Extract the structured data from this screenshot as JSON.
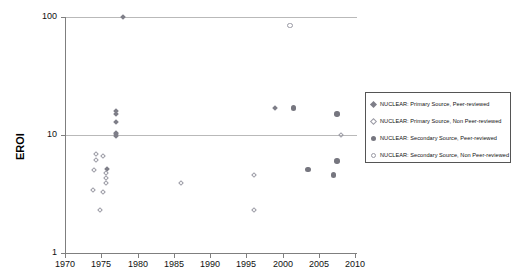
{
  "chart_data": {
    "type": "scatter",
    "title": "",
    "xlabel": "",
    "ylabel": "EROI",
    "xlim": [
      1970,
      2010
    ],
    "ylim": [
      1,
      100
    ],
    "yscale": "log",
    "grid": true,
    "legend_position": "right",
    "xticks": [
      "1970",
      "1975",
      "1980",
      "1985",
      "1990",
      "1995",
      "2000",
      "2005",
      "2010"
    ],
    "yticks": [
      "1",
      "10",
      "100"
    ],
    "series": [
      {
        "name": "NUCLEAR: Primary Source, Peer-reviewed",
        "marker": "filled-diamond",
        "color": "#7e7e88",
        "points": [
          {
            "x": 1978,
            "y": 100
          },
          {
            "x": 1977,
            "y": 16
          },
          {
            "x": 1977,
            "y": 15
          },
          {
            "x": 1977,
            "y": 13
          },
          {
            "x": 1977,
            "y": 10.4
          },
          {
            "x": 1977,
            "y": 10.1
          },
          {
            "x": 1977,
            "y": 9.8
          },
          {
            "x": 1975.8,
            "y": 5.2
          },
          {
            "x": 1999,
            "y": 17
          }
        ]
      },
      {
        "name": "NUCLEAR: Primary Source, Non Peer-reviewed",
        "marker": "open-diamond",
        "color": "#9a9aa4",
        "points": [
          {
            "x": 1974.3,
            "y": 6.9
          },
          {
            "x": 1975.3,
            "y": 6.7
          },
          {
            "x": 1974.3,
            "y": 6.1
          },
          {
            "x": 1974.0,
            "y": 5.1
          },
          {
            "x": 1975.6,
            "y": 4.8
          },
          {
            "x": 1975.6,
            "y": 4.3
          },
          {
            "x": 1975.6,
            "y": 3.9
          },
          {
            "x": 1973.8,
            "y": 3.4
          },
          {
            "x": 1975.3,
            "y": 3.3
          },
          {
            "x": 1974.8,
            "y": 2.3
          },
          {
            "x": 1986,
            "y": 3.9
          },
          {
            "x": 1996,
            "y": 4.6
          },
          {
            "x": 1996,
            "y": 2.3
          },
          {
            "x": 2008,
            "y": 10
          }
        ]
      },
      {
        "name": "NUCLEAR: Secondary Source, Peer-reviewed",
        "marker": "filled-circle",
        "color": "#76767f",
        "points": [
          {
            "x": 2001.5,
            "y": 17
          },
          {
            "x": 2007.5,
            "y": 15
          },
          {
            "x": 2003.5,
            "y": 5.1
          },
          {
            "x": 2007.5,
            "y": 6.0
          },
          {
            "x": 2007.0,
            "y": 4.6
          }
        ]
      },
      {
        "name": "NUCLEAR: Secondary Source, Non Peer-reviewed",
        "marker": "open-circle",
        "color": "#9a9aa4",
        "points": [
          {
            "x": 2001,
            "y": 85
          }
        ]
      }
    ],
    "legend": [
      {
        "label": "NUCLEAR: Primary Source, Peer-reviewed",
        "marker": "filled-diamond"
      },
      {
        "label": "NUCLEAR: Primary Source, Non Peer-reviewed",
        "marker": "open-diamond"
      },
      {
        "label": "NUCLEAR: Secondary Source, Peer-reviewed",
        "marker": "filled-circle"
      },
      {
        "label": "NUCLEAR: Secondary Source, Non Peer-reviewed",
        "marker": "open-circle"
      }
    ]
  }
}
